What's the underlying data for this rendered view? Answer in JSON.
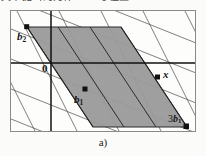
{
  "page": {
    "header_text_cropped": "文中提出的为什么 —号位置 ……",
    "caption": "a)",
    "background_color": "#fbfbfa"
  },
  "figure": {
    "frame": {
      "border_color": "#8a8a8a",
      "fill_color": "#fdfdfc",
      "x": 10,
      "y": 10,
      "width": 186,
      "height": 122
    },
    "colors": {
      "lattice_line": "#4a4a4a",
      "axis_line": "#111111",
      "shaded_region_fill": "#9a9a9a",
      "shaded_region_stroke": "#2a2a2a",
      "point_marker": "#111111",
      "label_text": "#171717"
    },
    "axes": {
      "x_axis_y": 62,
      "y_axis_x": 50,
      "origin_label": "0"
    },
    "labels": [
      {
        "id": "b2",
        "text": "b",
        "subscript": "2",
        "coefficient": "",
        "x": 17,
        "y": 31
      },
      {
        "id": "origin",
        "text": "0",
        "subscript": "",
        "coefficient": "",
        "x": 42,
        "y": 63
      },
      {
        "id": "b1",
        "text": "b",
        "subscript": "1",
        "coefficient": "",
        "x": 74,
        "y": 94
      },
      {
        "id": "x",
        "text": "x",
        "subscript": "",
        "coefficient": "",
        "x": 163,
        "y": 69
      },
      {
        "id": "3b1",
        "text": "b",
        "subscript": "1",
        "coefficient": "3",
        "x": 168,
        "y": 114
      }
    ],
    "points": [
      {
        "id": "point-b2",
        "label": "b2",
        "x": 26,
        "y": 26
      },
      {
        "id": "point-b1",
        "label": "b1",
        "x": 84,
        "y": 88
      },
      {
        "id": "point-x",
        "label": "x",
        "x": 157,
        "y": 76
      },
      {
        "id": "point-3b1",
        "label": "3b1",
        "x": 186,
        "y": 126
      }
    ],
    "shaded_parallelogram": {
      "description": "fundamental domain / parallelogram spanned by basis vectors b1 and b2 scaled to x",
      "vertices": [
        {
          "x": 26,
          "y": 26
        },
        {
          "x": 120,
          "y": 26
        },
        {
          "x": 186,
          "y": 126
        },
        {
          "x": 92,
          "y": 126
        }
      ]
    },
    "lattice": {
      "family_a_slope_desc": "steep down-right",
      "family_b_slope_desc": "shallow down-right",
      "family_a_count": 9,
      "family_b_count": 7
    }
  }
}
